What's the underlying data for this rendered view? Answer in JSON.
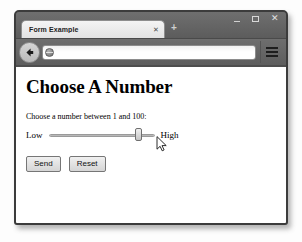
{
  "window": {
    "controls": {
      "minimize_label": "–",
      "maximize_label": "▢",
      "close_label": "✕"
    }
  },
  "tabs": [
    {
      "title": "Form Example",
      "close_label": "✕"
    }
  ],
  "new_tab_label": "+",
  "toolbar": {
    "back_icon": "back-arrow-icon",
    "site_icon": "globe-icon",
    "url_value": "",
    "url_placeholder": "",
    "menu_icon": "hamburger-menu-icon"
  },
  "page": {
    "heading": "Choose A Number",
    "field_label": "Choose a number between 1 and 100:",
    "slider": {
      "low_label": "Low",
      "high_label": "High",
      "min": 1,
      "max": 100,
      "value": 85,
      "thumb_percent": 85
    },
    "buttons": {
      "submit_label": "Send",
      "reset_label": "Reset"
    }
  },
  "cursor": {
    "icon": "mouse-pointer-icon"
  },
  "colors": {
    "chrome_dark": "#5c5c5c",
    "window_border": "#3c3c3c",
    "page_background": "#ffffff",
    "button_face": "#e0e0e0"
  }
}
